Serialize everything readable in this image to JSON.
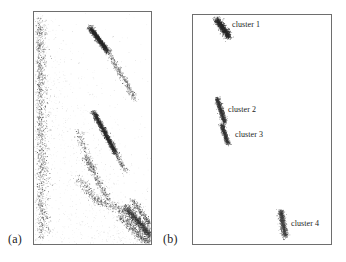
{
  "figure": {
    "panels": [
      {
        "id": "a",
        "caption": "(a)",
        "description": "full scatter of all detections"
      },
      {
        "id": "b",
        "caption": "(b)",
        "description": "extracted clusters only"
      }
    ]
  },
  "cluster_labels": [
    {
      "id": "cluster-1",
      "text": "cluster 1",
      "x": 232,
      "y": 20
    },
    {
      "id": "cluster-2",
      "text": "cluster 2",
      "x": 228,
      "y": 105
    },
    {
      "id": "cluster-3",
      "text": "cluster 3",
      "x": 235,
      "y": 130
    },
    {
      "id": "cluster-4",
      "text": "cluster 4",
      "x": 291,
      "y": 219
    }
  ],
  "chart_data": {
    "type": "scatter",
    "title": "",
    "xlabel": "",
    "ylabel": "",
    "grid": false,
    "legend": "none",
    "panels": [
      {
        "id": "a",
        "label": "(a)",
        "xlim": [
          0,
          119
        ],
        "ylim": [
          0,
          234
        ],
        "note": "dense point cloud: diffuse background scatter plus four linear dense streaks",
        "features": [
          {
            "name": "dense-streak-1",
            "x1": 58,
            "y1": 18,
            "x2": 74,
            "y2": 38,
            "density": "high"
          },
          {
            "name": "diffuse-trail-1",
            "x1": 74,
            "y1": 38,
            "x2": 102,
            "y2": 86,
            "density": "low"
          },
          {
            "name": "dense-streak-2",
            "x1": 62,
            "y1": 102,
            "x2": 82,
            "y2": 140,
            "density": "high"
          },
          {
            "name": "diffuse-trail-2",
            "x1": 56,
            "y1": 148,
            "x2": 78,
            "y2": 186,
            "density": "low"
          },
          {
            "name": "dense-streak-3",
            "x1": 96,
            "y1": 196,
            "x2": 130,
            "y2": 236,
            "density": "high"
          },
          {
            "name": "left-edge-band",
            "x1": 38,
            "y1": 14,
            "x2": 44,
            "y2": 232,
            "density": "medium"
          },
          {
            "name": "background-wedge",
            "x1": 38,
            "y1": 20,
            "x2": 140,
            "y2": 240,
            "density": "low"
          }
        ]
      },
      {
        "id": "b",
        "label": "(b)",
        "xlim": [
          0,
          140
        ],
        "ylim": [
          0,
          231
        ],
        "note": "only four isolated clusters remain after extraction",
        "clusters": [
          {
            "name": "cluster 1",
            "cx": 222,
            "cy": 27,
            "angle": 55,
            "length": 22,
            "width": 6,
            "points": 120
          },
          {
            "name": "cluster 2",
            "cx": 220,
            "cy": 110,
            "angle": 72,
            "length": 26,
            "width": 4,
            "points": 90
          },
          {
            "name": "cluster 3",
            "cx": 224,
            "cy": 134,
            "angle": 72,
            "length": 20,
            "width": 4,
            "points": 70
          },
          {
            "name": "cluster 4",
            "cx": 283,
            "cy": 224,
            "angle": 80,
            "length": 26,
            "width": 5,
            "points": 85
          }
        ]
      }
    ]
  }
}
